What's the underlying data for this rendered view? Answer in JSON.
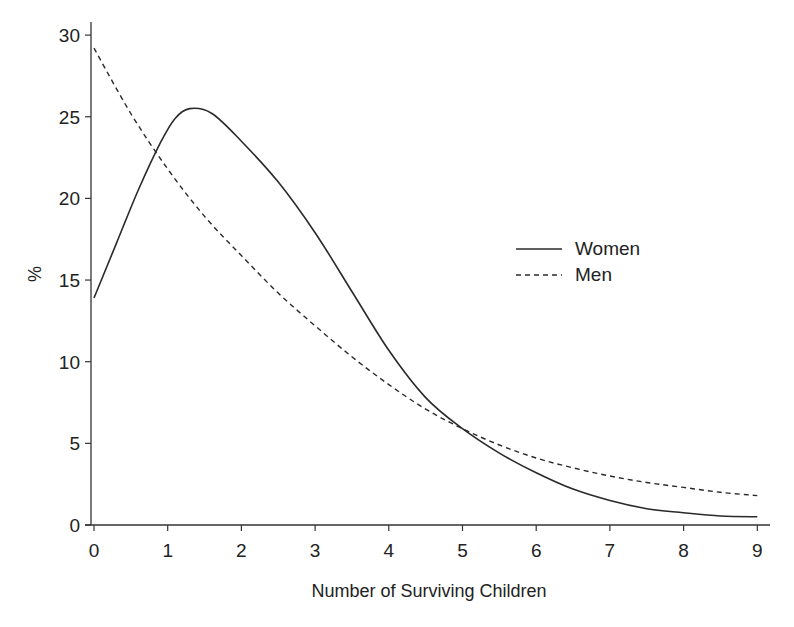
{
  "chart_data": {
    "type": "line",
    "title": "",
    "xlabel": "Number of Surviving Children",
    "ylabel": "%",
    "xlim": [
      0,
      9
    ],
    "ylim": [
      0,
      30
    ],
    "x_ticks": [
      0,
      1,
      2,
      3,
      4,
      5,
      6,
      7,
      8,
      9
    ],
    "y_ticks": [
      0,
      5,
      10,
      15,
      20,
      25,
      30
    ],
    "grid": false,
    "legend_position": "right-middle",
    "series": [
      {
        "name": "Women",
        "style": "solid",
        "x": [
          0,
          0.3,
          0.6,
          0.9,
          1.1,
          1.3,
          1.6,
          2,
          2.5,
          3,
          3.5,
          4,
          4.5,
          5,
          5.5,
          6,
          6.5,
          7,
          7.5,
          8,
          8.5,
          9
        ],
        "values": [
          13.9,
          17.2,
          20.5,
          23.4,
          24.9,
          25.5,
          25.2,
          23.5,
          21.0,
          17.9,
          14.3,
          10.7,
          7.8,
          5.9,
          4.4,
          3.2,
          2.2,
          1.5,
          1.0,
          0.75,
          0.55,
          0.5
        ]
      },
      {
        "name": "Men",
        "style": "dashed",
        "x": [
          0,
          0.5,
          1,
          1.5,
          2,
          2.5,
          3,
          3.5,
          4,
          4.5,
          5,
          5.5,
          6,
          6.5,
          7,
          7.5,
          8,
          8.5,
          9
        ],
        "values": [
          29.2,
          25.2,
          21.8,
          18.9,
          16.5,
          14.2,
          12.2,
          10.3,
          8.6,
          7.1,
          5.9,
          4.9,
          4.1,
          3.5,
          3.0,
          2.6,
          2.3,
          2.0,
          1.8
        ]
      }
    ]
  },
  "legend": {
    "items": [
      {
        "label": "Women",
        "style": "solid"
      },
      {
        "label": "Men",
        "style": "dashed"
      }
    ]
  },
  "axes": {
    "x_title": "Number of Surviving Children",
    "y_title": "%",
    "x_tick_labels": [
      "0",
      "1",
      "2",
      "3",
      "4",
      "5",
      "6",
      "7",
      "8",
      "9"
    ],
    "y_tick_labels": [
      "0",
      "5",
      "10",
      "15",
      "20",
      "25",
      "30"
    ]
  },
  "colors": {
    "line": "#2a2a2a",
    "axis": "#333333",
    "background": "#ffffff"
  }
}
